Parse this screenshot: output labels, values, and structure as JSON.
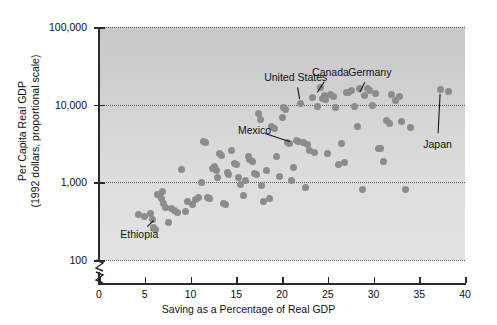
{
  "chart_data": {
    "type": "scatter",
    "title": "",
    "xlabel": "Saving as a Percentage of Real GDP",
    "ylabel_line1": "Per Capita Real GDP",
    "ylabel_line2": "(1992 dollars, proportional scale)",
    "xlim": [
      0,
      40
    ],
    "ylim": [
      100,
      100000
    ],
    "yscale": "log",
    "grid": "horizontal-dotted",
    "legend": "none",
    "xticks": [
      "0",
      "5",
      "10",
      "15",
      "20",
      "25",
      "30",
      "35",
      "40"
    ],
    "xtick_values": [
      0,
      5,
      10,
      15,
      20,
      25,
      30,
      35,
      40
    ],
    "yticks": [
      "100",
      "1,000",
      "10,000",
      "100,000"
    ],
    "ytick_values": [
      100,
      1000,
      10000,
      100000
    ],
    "axis_break": true,
    "marker_color": "#8c8c8c",
    "plot_background": "#d5d5d5",
    "points": [
      [
        4.3,
        380
      ],
      [
        5.0,
        360
      ],
      [
        5.6,
        400
      ],
      [
        5.8,
        330
      ],
      [
        6.0,
        260
      ],
      [
        6.2,
        250
      ],
      [
        6.4,
        700
      ],
      [
        6.6,
        680
      ],
      [
        6.8,
        620
      ],
      [
        6.9,
        760
      ],
      [
        7.1,
        540
      ],
      [
        7.3,
        480
      ],
      [
        7.6,
        300
      ],
      [
        7.9,
        460
      ],
      [
        8.2,
        430
      ],
      [
        8.6,
        410
      ],
      [
        9.0,
        1450
      ],
      [
        9.4,
        420
      ],
      [
        9.7,
        560
      ],
      [
        10.2,
        520
      ],
      [
        10.6,
        600
      ],
      [
        10.9,
        640
      ],
      [
        11.2,
        1000
      ],
      [
        11.4,
        3400
      ],
      [
        11.6,
        3250
      ],
      [
        11.9,
        640
      ],
      [
        12.1,
        620
      ],
      [
        12.4,
        1500
      ],
      [
        12.6,
        1600
      ],
      [
        12.8,
        1400
      ],
      [
        13.0,
        1150
      ],
      [
        13.2,
        2350
      ],
      [
        13.4,
        2200
      ],
      [
        13.6,
        540
      ],
      [
        13.8,
        520
      ],
      [
        14.0,
        1350
      ],
      [
        14.2,
        1280
      ],
      [
        14.5,
        2550
      ],
      [
        14.8,
        1750
      ],
      [
        15.0,
        1700
      ],
      [
        15.2,
        1150
      ],
      [
        15.5,
        950
      ],
      [
        15.8,
        680
      ],
      [
        16.0,
        1050
      ],
      [
        16.3,
        2150
      ],
      [
        16.5,
        1950
      ],
      [
        16.8,
        1850
      ],
      [
        17.0,
        1300
      ],
      [
        17.2,
        1250
      ],
      [
        17.4,
        7800
      ],
      [
        17.6,
        6400
      ],
      [
        17.8,
        920
      ],
      [
        18.0,
        560
      ],
      [
        18.3,
        1400
      ],
      [
        18.6,
        620
      ],
      [
        18.9,
        5200
      ],
      [
        19.2,
        4900
      ],
      [
        19.4,
        2150
      ],
      [
        19.7,
        1200
      ],
      [
        20.0,
        6800
      ],
      [
        20.2,
        9200
      ],
      [
        20.4,
        8600
      ],
      [
        20.6,
        3300
      ],
      [
        20.8,
        3200
      ],
      [
        21.0,
        1050
      ],
      [
        21.3,
        1550
      ],
      [
        21.6,
        3450
      ],
      [
        21.8,
        3400
      ],
      [
        22.0,
        10500
      ],
      [
        22.3,
        3250
      ],
      [
        22.6,
        870
      ],
      [
        22.8,
        3100
      ],
      [
        23.0,
        2600
      ],
      [
        23.3,
        12500
      ],
      [
        23.6,
        2400
      ],
      [
        23.9,
        9600
      ],
      [
        24.2,
        16500
      ],
      [
        24.4,
        12000
      ],
      [
        24.6,
        13200
      ],
      [
        24.8,
        11500
      ],
      [
        25.0,
        2350
      ],
      [
        25.3,
        13500
      ],
      [
        25.6,
        12800
      ],
      [
        25.9,
        9100
      ],
      [
        26.2,
        1700
      ],
      [
        26.5,
        3200
      ],
      [
        26.8,
        1800
      ],
      [
        27.0,
        14500
      ],
      [
        27.3,
        14200
      ],
      [
        27.6,
        15000
      ],
      [
        27.9,
        9400
      ],
      [
        28.2,
        5200
      ],
      [
        28.5,
        16200
      ],
      [
        28.8,
        820
      ],
      [
        29.0,
        13000
      ],
      [
        29.3,
        16000
      ],
      [
        29.6,
        15200
      ],
      [
        29.9,
        9800
      ],
      [
        30.2,
        13800
      ],
      [
        30.5,
        2750
      ],
      [
        30.8,
        2700
      ],
      [
        31.1,
        1850
      ],
      [
        31.4,
        6200
      ],
      [
        31.7,
        5800
      ],
      [
        32.0,
        13600
      ],
      [
        32.4,
        11200
      ],
      [
        32.8,
        12900
      ],
      [
        33.1,
        6100
      ],
      [
        33.5,
        800
      ],
      [
        34.0,
        5100
      ],
      [
        37.3,
        15500
      ],
      [
        38.2,
        14800
      ]
    ],
    "annotations": [
      {
        "label": "United States",
        "x": 21.5,
        "y": 23000,
        "point_x": 22.0,
        "point_y": 10500
      },
      {
        "label": "Canada",
        "x": 25.3,
        "y": 26000,
        "point_x": 23.6,
        "point_y": 13000
      },
      {
        "label": "Germany",
        "x": 29.6,
        "y": 26000,
        "point_x": 28.3,
        "point_y": 13000
      },
      {
        "label": "Mexico",
        "x": 17.0,
        "y": 4700,
        "point_x": 21.3,
        "point_y": 3200
      },
      {
        "label": "Japan",
        "x": 37.0,
        "y": 3100,
        "point_x": 37.3,
        "point_y": 15500
      },
      {
        "label": "Ethiopia",
        "x": 4.4,
        "y": 215,
        "point_x": 6.3,
        "point_y": 350
      }
    ]
  }
}
